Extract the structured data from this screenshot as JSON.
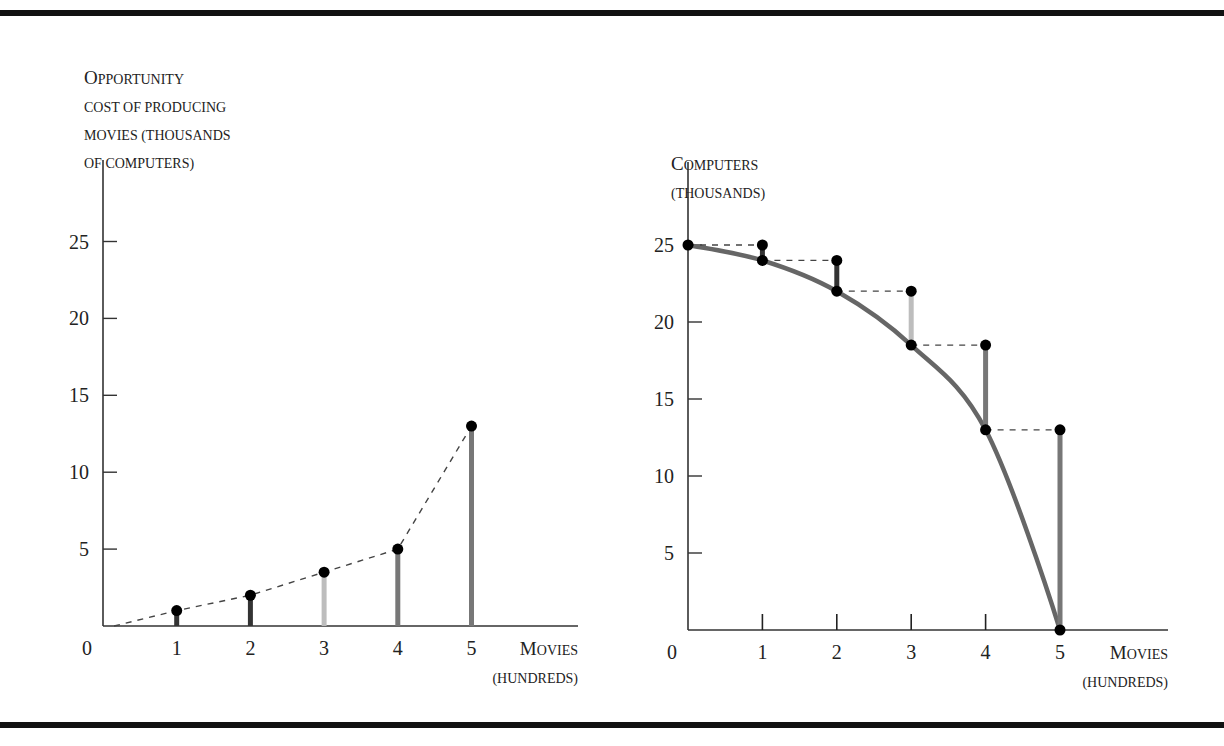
{
  "chart_data": [
    {
      "type": "bar",
      "subtype": "lollipop",
      "title": "",
      "ylabel_lines": [
        "Opportunity",
        "cost of producing",
        "movies (thousands",
        "of computers)"
      ],
      "xlabel_lines": [
        "Movies",
        "(hundreds)"
      ],
      "origin_label": "0",
      "x": [
        1,
        2,
        3,
        4,
        5
      ],
      "x_tick_labels": [
        "1",
        "2",
        "3",
        "4",
        "5"
      ],
      "values": [
        1,
        2,
        3.5,
        5,
        13
      ],
      "stem_colors": [
        "#333333",
        "#333333",
        "#bdbdbd",
        "#777777",
        "#777777"
      ],
      "y_ticks": [
        5,
        10,
        15,
        20,
        25
      ],
      "y_tick_labels": [
        "5",
        "10",
        "15",
        "20",
        "25"
      ],
      "xlim": [
        0,
        6.3
      ],
      "ylim": [
        0,
        30
      ],
      "connector": "dashed",
      "grid": false
    },
    {
      "type": "line",
      "title": "",
      "ylabel_lines": [
        "Computers",
        "(thousands)"
      ],
      "xlabel_lines": [
        "Movies",
        "(hundreds)"
      ],
      "origin_label": "0",
      "x": [
        0,
        1,
        2,
        3,
        4,
        5
      ],
      "x_tick_labels": [
        "1",
        "2",
        "3",
        "4",
        "5"
      ],
      "series": [
        {
          "name": "Production possibilities frontier",
          "values": [
            25,
            24,
            22,
            18.5,
            13,
            0
          ],
          "color": "#666666"
        }
      ],
      "steps": [
        {
          "x": 1,
          "from": 25,
          "to": 24,
          "color": "#333333"
        },
        {
          "x": 2,
          "from": 24,
          "to": 22,
          "color": "#333333"
        },
        {
          "x": 3,
          "from": 22,
          "to": 18.5,
          "color": "#bdbdbd"
        },
        {
          "x": 4,
          "from": 18.5,
          "to": 13,
          "color": "#777777"
        },
        {
          "x": 5,
          "from": 13,
          "to": 0,
          "color": "#777777"
        }
      ],
      "y_ticks": [
        5,
        10,
        15,
        20,
        25
      ],
      "y_tick_labels": [
        "5",
        "10",
        "15",
        "20",
        "25"
      ],
      "xlim": [
        0,
        6.5
      ],
      "ylim": [
        0,
        30
      ],
      "grid": false
    }
  ]
}
